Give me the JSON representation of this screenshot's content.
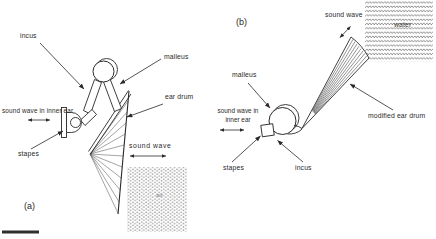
{
  "figure": {
    "panels": {
      "a": {
        "tag": "(a)",
        "labels": {
          "incus": "incus",
          "malleus": "malleus",
          "ear_drum": "ear drum",
          "sound_wave_inner_ear": "sound wave in inner ear",
          "stapes": "stapes",
          "sound_wave": "sound wave",
          "air": "air"
        }
      },
      "b": {
        "tag": "(b)",
        "labels": {
          "sound_wave": "sound wave",
          "water": "water",
          "malleus": "malleus",
          "modified_ear_drum": "modified ear drum",
          "sound_wave_inner_ear_line1": "sound wave in",
          "sound_wave_inner_ear_line2": "inner ear",
          "stapes": "stapes",
          "incus": "incus"
        }
      }
    },
    "colors": {
      "ink": "#2a2a2a",
      "texture_gray": "#777777",
      "background": "#ffffff"
    }
  }
}
